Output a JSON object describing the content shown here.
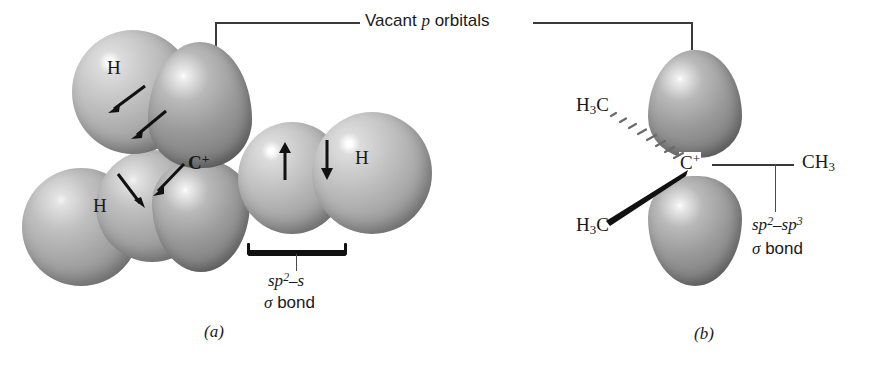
{
  "figure": {
    "top_bracket_label": "Vacant p orbitals",
    "top_bracket_label_plain": "Vacant",
    "top_bracket_label_italic": "p",
    "top_bracket_label_tail": "orbitals"
  },
  "panel_a": {
    "caption": "(a)",
    "center_atom": "C",
    "center_charge": "+",
    "hydrogen_labels": [
      "H",
      "H",
      "H"
    ],
    "bond_label_line1_a": "sp",
    "bond_label_line1_sup": "2",
    "bond_label_line1_b": "–s",
    "bond_label_line2_sigma": "σ",
    "bond_label_line2_text": "bond",
    "bond_label_full": "sp2–s σ bond"
  },
  "panel_b": {
    "caption": "(b)",
    "center_atom": "C",
    "center_charge": "+",
    "methyl_back": "H3C",
    "methyl_front": "H3C",
    "methyl_right": "CH3",
    "bond_label_line1_a": "sp",
    "bond_label_line1_sup1": "2",
    "bond_label_line1_b": "–sp",
    "bond_label_line1_sup2": "3",
    "bond_label_line2_sigma": "σ",
    "bond_label_line2_text": "bond",
    "bond_label_full": "sp2–sp3 σ bond"
  },
  "colors": {
    "ink": "#1a1a1a",
    "rule": "#3a3a3a",
    "brace": "#111111",
    "sphere_light": "#c6c6c6",
    "lobe_dark": "#8a8a8a",
    "background": "#ffffff"
  }
}
